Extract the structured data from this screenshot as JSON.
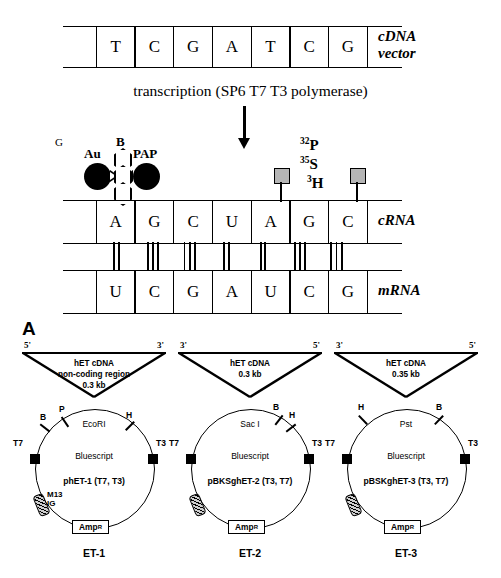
{
  "figure": {
    "panel_letter": "A",
    "transcription_label": "transcription   (SP6 T7 T3 polymerase)"
  },
  "strands": {
    "cdna": {
      "bases": [
        "T",
        "C",
        "G",
        "A",
        "T",
        "C",
        "G"
      ],
      "label_line1": "cDNA",
      "label_line2": "vector"
    },
    "crna": {
      "bases": [
        "A",
        "G",
        "C",
        "U",
        "A",
        "G",
        "C"
      ],
      "label": "cRNA"
    },
    "mrna": {
      "bases": [
        "U",
        "C",
        "G",
        "A",
        "U",
        "C",
        "G"
      ],
      "label": "mRNA"
    },
    "hydrogen_bonds": [
      2,
      3,
      3,
      2,
      2,
      3,
      3
    ]
  },
  "probe_labels": {
    "glycoprotein": "G",
    "gold": "Au",
    "biotin": "B",
    "pap": "PAP",
    "isotopes": [
      {
        "mass": "32",
        "element": "P"
      },
      {
        "mass": "35",
        "element": "S"
      },
      {
        "mass": "3",
        "element": "H"
      }
    ]
  },
  "plasmids": [
    {
      "id": "et-1",
      "caption": "ET-1",
      "left_prime": "5'",
      "right_prime": "3'",
      "insert_lines": [
        "hET cDNA",
        "non-coding region",
        "0.3 kb"
      ],
      "enzyme": "EcoRI",
      "vector": "Bluescript",
      "name": "phET-1 (T7, T3)",
      "promoter_left": "T7",
      "promoter_right": "T3",
      "amp": "Amp",
      "amp_sup": "R",
      "m13_line1": "M13",
      "m13_line2": "IG",
      "sites": [
        {
          "label": "B",
          "x": 26,
          "y": 74,
          "tick_x": 30,
          "tick_y": 84,
          "tick_rot": -52
        },
        {
          "label": "P",
          "x": 45,
          "y": 66,
          "tick_x": 50,
          "tick_y": 78,
          "tick_rot": -34
        },
        {
          "label": "H",
          "x": 112,
          "y": 72,
          "tick_x": 115,
          "tick_y": 82,
          "tick_rot": 45
        }
      ]
    },
    {
      "id": "et-2",
      "caption": "ET-2",
      "left_prime": "3'",
      "right_prime": "5'",
      "insert_lines": [
        "hET cDNA",
        "0.3 kb"
      ],
      "enzyme": "Sac I",
      "vector": "Bluescript",
      "name": "pBKSghET-2 (T3, T7)",
      "promoter_left": "T7",
      "promoter_right": "T3",
      "amp": "Amp",
      "amp_sup": "R",
      "m13_line1": "",
      "m13_line2": "",
      "sites": [
        {
          "label": "B",
          "x": 103,
          "y": 64,
          "tick_x": 108,
          "tick_y": 76,
          "tick_rot": 38
        },
        {
          "label": "H",
          "x": 119,
          "y": 72,
          "tick_x": 120,
          "tick_y": 84,
          "tick_rot": 52
        }
      ]
    },
    {
      "id": "et-3",
      "caption": "ET-3",
      "left_prime": "3'",
      "right_prime": "5'",
      "insert_lines": [
        "hET cDNA",
        "0.35 kb"
      ],
      "enzyme": "Pst",
      "vector": "Bluescript",
      "name": "pBSKghET-3 (T3, T7)",
      "promoter_left": "T7",
      "promoter_right": "T3",
      "amp": "Amp",
      "amp_sup": "R",
      "m13_line1": "",
      "m13_line2": "",
      "sites": [
        {
          "label": "H",
          "x": 32,
          "y": 64,
          "tick_x": 36,
          "tick_y": 76,
          "tick_rot": -44
        },
        {
          "label": "B",
          "x": 110,
          "y": 64,
          "tick_x": 112,
          "tick_y": 76,
          "tick_rot": 44
        }
      ]
    }
  ]
}
